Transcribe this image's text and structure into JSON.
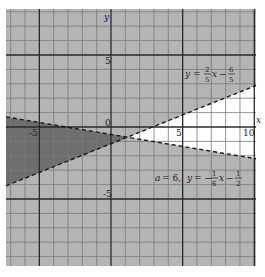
{
  "chart_data": {
    "type": "line",
    "title": "",
    "xlabel": "x",
    "ylabel": "y",
    "xlim": [
      -7.2,
      10.2
    ],
    "ylim": [
      -9.6,
      8.2
    ],
    "grid": true,
    "x_ticks": [
      {
        "value": -5,
        "label": "-5"
      },
      {
        "value": 5,
        "label": "5"
      },
      {
        "value": 10,
        "label": "10"
      }
    ],
    "y_ticks": [
      {
        "value": 5,
        "label": "5"
      },
      {
        "value": -5,
        "label": "-5"
      }
    ],
    "origin_label": "0",
    "series": [
      {
        "name": "y = (2/5)x - 6/5",
        "slope": 0.4,
        "intercept": -1.2,
        "style": "dashed",
        "points": [
          [
            -7.2,
            -4.08
          ],
          [
            10.2,
            2.88
          ]
        ]
      },
      {
        "name": "a = 6, y = -(1/6)x - 1/2",
        "slope": -0.16667,
        "intercept": -0.5,
        "style": "dashed",
        "points": [
          [
            -7.2,
            0.7
          ],
          [
            10.2,
            -2.2
          ]
        ]
      }
    ],
    "intersection": [
      1.235,
      -0.706
    ],
    "regions": [
      {
        "name": "unshaded",
        "description": "y < (2/5)x - 6/5 and y > -(1/6)x - 1/2",
        "color": "#ffffff"
      },
      {
        "name": "double-shaded",
        "description": "y > (2/5)x - 6/5 and y < -(1/6)x - 1/2",
        "color": "#6e6e6e"
      },
      {
        "name": "single-shaded",
        "description": "elsewhere",
        "color": "#b4b4b4"
      }
    ],
    "annotations": [
      {
        "text": "y = 2/5 x − 6/5",
        "x": 7.2,
        "y": 3.6
      },
      {
        "text": "a = 6,  y = −1/6 x − 1/2",
        "x": 4.6,
        "y": -4.1
      }
    ]
  },
  "labels": {
    "x_axis": "x",
    "y_axis": "y",
    "origin": "0",
    "tick_x_neg5": "-5",
    "tick_x_5": "5",
    "tick_x_10": "10",
    "tick_y_5": "5",
    "tick_y_neg5": "-5",
    "eq1": {
      "y": "y",
      "eq": "=",
      "num1": "2",
      "den1": "5",
      "x": "x",
      "minus": "−",
      "num2": "6",
      "den2": "5"
    },
    "eq2": {
      "a": "a",
      "eq_a": "= 6,",
      "y": "y",
      "eq": "= −",
      "num1": "1",
      "den1": "6",
      "x": "x",
      "minus": "−",
      "num2": "1",
      "den2": "2"
    }
  },
  "colors": {
    "background": "#ffffff",
    "light_shade": "#b4b4b4",
    "dark_shade": "#6e6e6e",
    "minor_grid": "#7a7a7a",
    "major_grid": "#2a2a2a",
    "dashed_line": "#1a1a1a"
  }
}
